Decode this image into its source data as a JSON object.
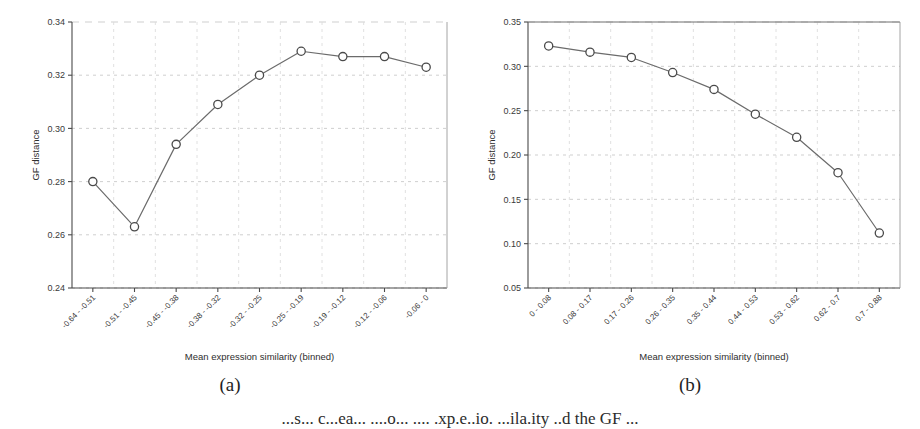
{
  "figure": {
    "bottom_caption": "...s... c...ea... ....o... .... .xp.e..io. ...ila.ity ..d the GF ...",
    "panels": [
      {
        "id": "a",
        "subcaption": "(a)"
      },
      {
        "id": "b",
        "subcaption": "(b)"
      }
    ]
  },
  "chart_data": [
    {
      "type": "line",
      "panel": "(a)",
      "title": "",
      "xlabel": "Mean expression similarity (binned)",
      "ylabel": "GF distance",
      "categories": [
        "-0.64 - -0.51",
        "-0.51 - -0.45",
        "-0.45 - -0.38",
        "-0.38 - -0.32",
        "-0.32 - -0.25",
        "-0.25 - -0.19",
        "-0.19 - -0.12",
        "-0.12 - -0.06",
        "-0.06 - 0"
      ],
      "values": [
        0.28,
        0.263,
        0.294,
        0.309,
        0.32,
        0.329,
        0.327,
        0.327,
        0.323
      ],
      "ylim": [
        0.24,
        0.34
      ],
      "yticks": [
        0.24,
        0.26,
        0.28,
        0.3,
        0.32,
        0.34
      ],
      "ytick_labels": [
        "0.24",
        "0.26",
        "0.28",
        "0.30",
        "0.32",
        "0.34"
      ],
      "grid": true,
      "legend": "none",
      "marker": "open-circle",
      "line_color": "#6b6b6b",
      "marker_edge_color": "#4a4a4a"
    },
    {
      "type": "line",
      "panel": "(b)",
      "title": "",
      "xlabel": "Mean expression similarity (binned)",
      "ylabel": "GF distance",
      "categories": [
        "0 - 0.08",
        "0.08 - 0.17",
        "0.17 - 0.26",
        "0.26 - 0.35",
        "0.35 - 0.44",
        "0.44 - 0.53",
        "0.53 - 0.62",
        "0.62 - 0.7",
        "0.7 - 0.88"
      ],
      "values": [
        0.323,
        0.316,
        0.31,
        0.293,
        0.274,
        0.246,
        0.22,
        0.18,
        0.112
      ],
      "ylim": [
        0.05,
        0.35
      ],
      "yticks": [
        0.05,
        0.1,
        0.15,
        0.2,
        0.25,
        0.3,
        0.35
      ],
      "ytick_labels": [
        "0.05",
        "0.10",
        "0.15",
        "0.20",
        "0.25",
        "0.30",
        "0.35"
      ],
      "grid": true,
      "legend": "none",
      "marker": "open-circle",
      "line_color": "#6b6b6b",
      "marker_edge_color": "#4a4a4a"
    }
  ]
}
